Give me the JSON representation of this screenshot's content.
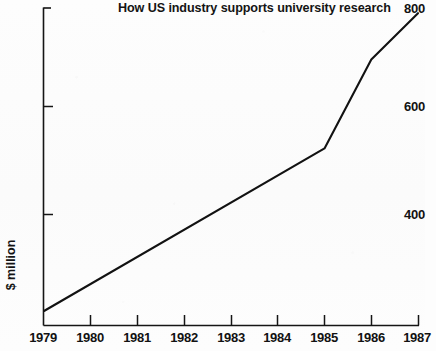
{
  "chart_data": {
    "type": "line",
    "title": "How US industry supports university research",
    "xlabel": "",
    "ylabel": "$ million",
    "x": [
      1979,
      1980,
      1981,
      1982,
      1983,
      1984,
      1985,
      1986,
      1987
    ],
    "xtick_labels": [
      "1979",
      "1980",
      "1981",
      "1982",
      "1983",
      "1984",
      "1985",
      "1986",
      "1987"
    ],
    "ytick_labels": [
      "800",
      "600",
      "400"
    ],
    "ytick_values": [
      800,
      600,
      400
    ],
    "xlim": [
      1979,
      1987
    ],
    "ylim": [
      213,
      800
    ],
    "grid": false,
    "legend": null,
    "series": [
      {
        "name": "US industry support for university research",
        "units": "$ million",
        "values": [
          213,
          265,
          318,
          371,
          423,
          476,
          528,
          700,
          790
        ]
      }
    ],
    "vertices": [
      {
        "x": 1979,
        "y": 213
      },
      {
        "x": 1985,
        "y": 528
      },
      {
        "x": 1986,
        "y": 700
      },
      {
        "x": 1987,
        "y": 790
      }
    ],
    "line_color": "#121212",
    "axis_color": "#151515",
    "background_color": "#fcfcfc"
  },
  "axes": {
    "y": {
      "ticks": [
        {
          "label": "800",
          "value": 800
        },
        {
          "label": "600",
          "value": 600
        },
        {
          "label": "400",
          "value": 400
        }
      ],
      "title": "$ million"
    },
    "x": {
      "ticks": [
        {
          "label": "1979",
          "value": 1979
        },
        {
          "label": "1980",
          "value": 1980
        },
        {
          "label": "1981",
          "value": 1981
        },
        {
          "label": "1982",
          "value": 1982
        },
        {
          "label": "1983",
          "value": 1983
        },
        {
          "label": "1984",
          "value": 1984
        },
        {
          "label": "1985",
          "value": 1985
        },
        {
          "label": "1986",
          "value": 1986
        },
        {
          "label": "1987",
          "value": 1987
        }
      ]
    }
  }
}
